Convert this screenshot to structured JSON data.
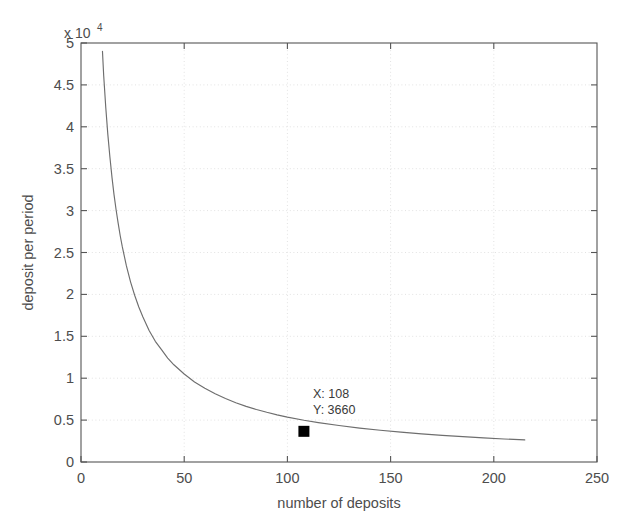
{
  "chart_data": {
    "type": "line",
    "title": "",
    "xlabel": "number of deposits",
    "ylabel": "deposit per period",
    "y_exponent_label": "x 10",
    "y_exponent_power": "4",
    "y_scale_factor": 10000,
    "xlim": [
      0,
      250
    ],
    "ylim": [
      0,
      50000
    ],
    "xticks": [
      0,
      50,
      100,
      150,
      200,
      250
    ],
    "xtick_labels": [
      "0",
      "50",
      "100",
      "150",
      "200",
      "250"
    ],
    "yticks": [
      0,
      5000,
      10000,
      15000,
      20000,
      25000,
      30000,
      35000,
      40000,
      45000,
      50000
    ],
    "ytick_labels": [
      "0",
      "0.5",
      "1",
      "1.5",
      "2",
      "2.5",
      "3",
      "3.5",
      "4",
      "4.5",
      "5"
    ],
    "grid": true,
    "grid_style": "dotted",
    "grid_color": "#e2e2e2",
    "legend": null,
    "line_color": "#6e6e6e",
    "line_width": 1,
    "series": [
      {
        "name": "deposit per period",
        "relation": "y = 400000 / x",
        "x": [
          10.4,
          11,
          12,
          13,
          14,
          15,
          16,
          17,
          18,
          19,
          20,
          22,
          24,
          26,
          28,
          30,
          33,
          36,
          39,
          42,
          45,
          50,
          55,
          60,
          65,
          70,
          75,
          80,
          85,
          90,
          95,
          100,
          108,
          115,
          125,
          135,
          145,
          155,
          165,
          175,
          185,
          195,
          205,
          215
        ],
        "y": [
          49000,
          46100,
          42300,
          39100,
          36400,
          34000,
          31900,
          30100,
          28500,
          27000,
          25700,
          23400,
          21500,
          19900,
          18500,
          17300,
          15700,
          14400,
          13400,
          12400,
          11600,
          10500,
          9550,
          8800,
          8150,
          7570,
          7070,
          6640,
          6260,
          5930,
          5630,
          5360,
          4980,
          4700,
          4350,
          4050,
          3790,
          3560,
          3360,
          3180,
          3020,
          2880,
          2750,
          2640
        ]
      }
    ],
    "annotations": [
      {
        "type": "datatip",
        "marker": "square",
        "marker_color": "#000000",
        "x": 108,
        "y": 3660,
        "x_label": "X: 108",
        "y_label": "Y: 3660"
      }
    ]
  },
  "axes": {
    "box_color": "#555555",
    "background": "#ffffff"
  }
}
